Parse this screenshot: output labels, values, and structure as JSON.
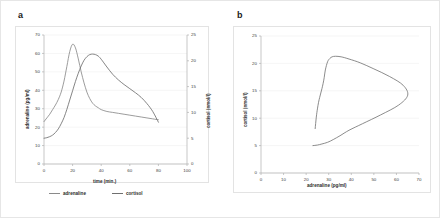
{
  "figure": {
    "background": "#ffffff",
    "border_color": "#e6e6e6",
    "grid_color": "#eeeeee",
    "axis_color": "#b0b0b0",
    "curve_color": "#7d7d7d"
  },
  "panels": {
    "a": {
      "label": "a",
      "legend": [
        {
          "name": "adrenaline",
          "color": "#8a8a8a"
        },
        {
          "name": "cortisol",
          "color": "#6f6f6f"
        }
      ],
      "ticks": {
        "x": [
          "0",
          "20",
          "40",
          "60",
          "80",
          "100"
        ],
        "y_left": [
          "0",
          "10",
          "20",
          "30",
          "40",
          "50",
          "60",
          "70"
        ],
        "y_right": [
          "0",
          "5",
          "10",
          "15",
          "20",
          "25"
        ]
      },
      "titles": {
        "x": "time (min.)",
        "y_left": "adrenaline (pg/ml)",
        "y_right": "cortisol (nmol/l)"
      }
    },
    "b": {
      "label": "b",
      "ticks": {
        "x": [
          "0",
          "10",
          "20",
          "30",
          "40",
          "50",
          "60",
          "70"
        ],
        "y": [
          "0",
          "5",
          "10",
          "15",
          "20",
          "25"
        ]
      },
      "titles": {
        "x": "adrenaline (pg/ml)",
        "y": "cortisol (nmol/l)"
      }
    }
  },
  "chart_data": [
    {
      "type": "line",
      "panel": "a",
      "title": "",
      "xlabel": "time (min.)",
      "ylabel": "adrenaline (pg/ml)",
      "y2label": "cortisol (nmol/l)",
      "xlim": [
        0,
        100
      ],
      "ylim": [
        0,
        70
      ],
      "y2lim": [
        0,
        25
      ],
      "grid": true,
      "legend_position": "bottom",
      "xticks": [
        0,
        20,
        40,
        60,
        80,
        100
      ],
      "yticks": [
        0,
        10,
        20,
        30,
        40,
        50,
        60,
        70
      ],
      "y2ticks": [
        0,
        5,
        10,
        15,
        20,
        25
      ],
      "x": [
        0,
        2,
        4,
        6,
        8,
        10,
        12,
        14,
        16,
        18,
        20,
        22,
        24,
        26,
        28,
        30,
        32,
        34,
        36,
        38,
        40,
        44,
        48,
        52,
        56,
        60,
        64,
        68,
        72,
        76,
        80
      ],
      "series": [
        {
          "name": "adrenaline",
          "axis": "left",
          "units": "pg/ml",
          "color": "#8a8a8a",
          "values": [
            23,
            25,
            27,
            29.5,
            32,
            35,
            39,
            45,
            53,
            61,
            65,
            63,
            57,
            50,
            44,
            39,
            35.5,
            33,
            31.5,
            30.5,
            29.5,
            28.5,
            28,
            27.5,
            27,
            26.5,
            26,
            25.5,
            25,
            24.5,
            24
          ]
        },
        {
          "name": "cortisol",
          "axis": "right",
          "units": "nmol/l",
          "color": "#6f6f6f",
          "values": [
            5,
            5.1,
            5.3,
            5.6,
            6.1,
            6.8,
            7.8,
            9.0,
            10.6,
            12.4,
            14.2,
            16.0,
            17.6,
            19.0,
            20.1,
            20.8,
            21.2,
            21.3,
            21.2,
            20.9,
            20.3,
            18.8,
            17.4,
            16.3,
            15.4,
            14.6,
            13.8,
            12.9,
            11.7,
            10.2,
            8.1
          ]
        }
      ]
    },
    {
      "type": "line",
      "panel": "b",
      "title": "",
      "xlabel": "adrenaline (pg/ml)",
      "ylabel": "cortisol (nmol/l)",
      "xlim": [
        0,
        70
      ],
      "ylim": [
        0,
        25
      ],
      "grid": true,
      "legend_position": "none",
      "xticks": [
        0,
        10,
        20,
        30,
        40,
        50,
        60,
        70
      ],
      "yticks": [
        0,
        5,
        10,
        15,
        20,
        25
      ],
      "series": [
        {
          "name": "cortisol vs adrenaline hysteresis loop",
          "color": "#6f6f6f",
          "x": [
            23,
            25,
            27,
            29.5,
            32,
            35,
            39,
            45,
            53,
            61,
            65,
            63,
            57,
            50,
            44,
            39,
            35.5,
            33,
            31.5,
            30.5,
            29.5,
            28.5,
            28,
            27.5,
            27,
            26.5,
            26,
            25.5,
            25,
            24.5,
            24
          ],
          "y": [
            5,
            5.1,
            5.3,
            5.6,
            6.1,
            6.8,
            7.8,
            9.0,
            10.6,
            12.4,
            14.2,
            16.0,
            17.6,
            19.0,
            20.1,
            20.8,
            21.2,
            21.3,
            21.2,
            20.9,
            20.3,
            18.8,
            17.4,
            16.3,
            15.4,
            14.6,
            13.8,
            12.9,
            11.7,
            10.2,
            8.1
          ]
        }
      ]
    }
  ]
}
